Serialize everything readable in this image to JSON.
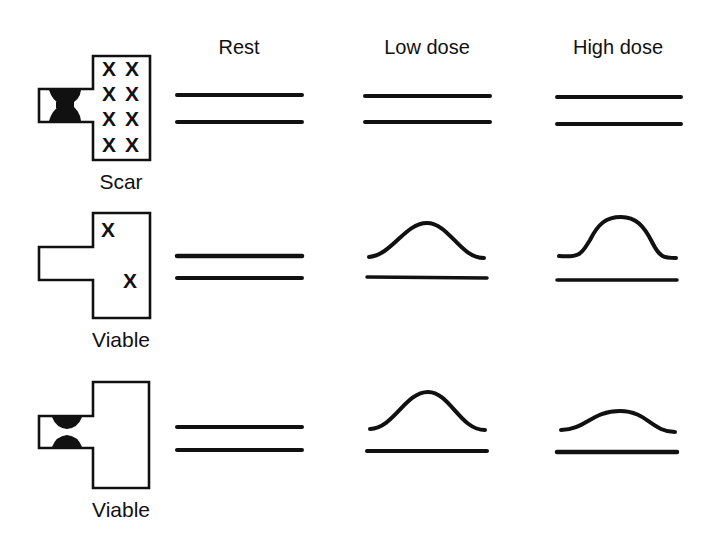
{
  "columns": [
    {
      "label": "Rest"
    },
    {
      "label": "Low dose"
    },
    {
      "label": "High dose"
    }
  ],
  "rows": [
    {
      "label": "Scar",
      "segment_marker": "X",
      "segment_marks": [
        "X",
        "X",
        "X",
        "X",
        "X",
        "X",
        "X",
        "X"
      ],
      "lumen_shape": "hourglass-occlusion",
      "responses": {
        "rest": "flat",
        "low_dose": "flat",
        "high_dose": "flat"
      }
    },
    {
      "label": "Viable",
      "segment_marker": "X",
      "segment_marks": [
        "X",
        "X"
      ],
      "lumen_shape": "open",
      "responses": {
        "rest": "flat",
        "low_dose": "improved",
        "high_dose": "further-improved"
      }
    },
    {
      "label": "Viable",
      "segment_marker": "",
      "segment_marks": [],
      "lumen_shape": "stenosis",
      "responses": {
        "rest": "flat",
        "low_dose": "improved",
        "high_dose": "worsened (biphasic)"
      }
    }
  ],
  "colors": {
    "ink": "#111111",
    "background": "#ffffff"
  }
}
